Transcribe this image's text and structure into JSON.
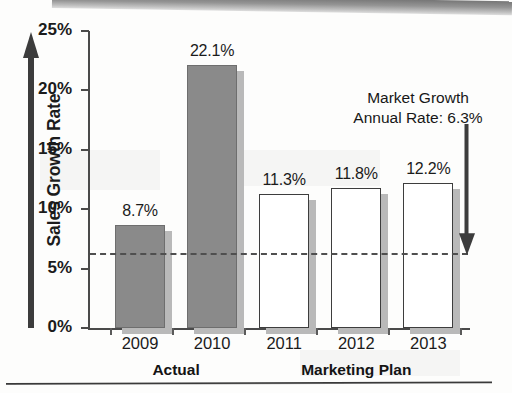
{
  "chart_data": {
    "type": "bar",
    "title": "",
    "xlabel": "",
    "ylabel": "Sales Growth Rate",
    "categories": [
      "2009",
      "2010",
      "2011",
      "2012",
      "2013"
    ],
    "values": [
      8.7,
      22.1,
      11.3,
      11.8,
      12.2
    ],
    "value_labels": [
      "8.7%",
      "22.1%",
      "11.3%",
      "11.8%",
      "12.2%"
    ],
    "ylim": [
      0,
      25
    ],
    "yticks": [
      0,
      5,
      10,
      15,
      20,
      25
    ],
    "ytick_labels": [
      "0%",
      "5%",
      "10%",
      "15%",
      "20%",
      "25%"
    ],
    "grid": false,
    "legend": "none",
    "bar_styles": [
      "filled",
      "filled",
      "hollow",
      "hollow",
      "hollow"
    ],
    "groups": [
      {
        "label": "Actual",
        "categories": [
          "2009",
          "2010"
        ]
      },
      {
        "label": "Marketing Plan",
        "categories": [
          "2011",
          "2012",
          "2013"
        ]
      }
    ],
    "reference_line": {
      "value": 6.3,
      "style": "dashed",
      "annotation_line1": "Market Growth",
      "annotation_line2": "Annual Rate: 6.3%"
    },
    "colors": {
      "filled_bar": "#8a8a8a",
      "hollow_bar": "#ffffff",
      "bar_outline": "#3d3d3d",
      "shadow": "#b9b9b9",
      "axis": "#4a4a4a",
      "text": "#1b1b1b",
      "reference_line": "#4f4f4f"
    }
  }
}
